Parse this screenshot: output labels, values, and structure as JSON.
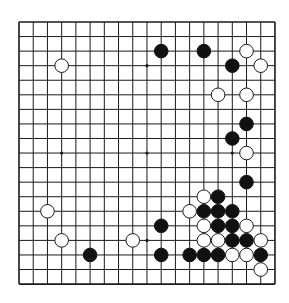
{
  "board": {
    "size": 19,
    "origin_x": 19,
    "origin_y": 22,
    "spacing_x": 14.22,
    "spacing_y": 14.56,
    "line_color": "#1a1a1a",
    "background": "#ffffff",
    "stone_radius": 6.8,
    "star_points": [
      [
        3,
        3
      ],
      [
        9,
        3
      ],
      [
        15,
        3
      ],
      [
        3,
        9
      ],
      [
        9,
        9
      ],
      [
        15,
        9
      ],
      [
        3,
        15
      ],
      [
        9,
        15
      ],
      [
        15,
        15
      ]
    ],
    "colors": {
      "black": "#111111",
      "white": "#ffffff",
      "white_stroke": "#1a1a1a"
    }
  },
  "stones": [
    {
      "color": "black",
      "col": 10,
      "row": 2
    },
    {
      "color": "black",
      "col": 13,
      "row": 2
    },
    {
      "color": "white",
      "col": 16,
      "row": 2
    },
    {
      "color": "white",
      "col": 3,
      "row": 3
    },
    {
      "color": "black",
      "col": 15,
      "row": 3
    },
    {
      "color": "white",
      "col": 17,
      "row": 3
    },
    {
      "color": "white",
      "col": 14,
      "row": 5
    },
    {
      "color": "white",
      "col": 16,
      "row": 5
    },
    {
      "color": "black",
      "col": 16,
      "row": 7
    },
    {
      "color": "black",
      "col": 15,
      "row": 8
    },
    {
      "color": "white",
      "col": 16,
      "row": 9
    },
    {
      "color": "black",
      "col": 16,
      "row": 11
    },
    {
      "color": "white",
      "col": 13,
      "row": 12
    },
    {
      "color": "black",
      "col": 14,
      "row": 12
    },
    {
      "color": "white",
      "col": 2,
      "row": 13
    },
    {
      "color": "white",
      "col": 12,
      "row": 13
    },
    {
      "color": "black",
      "col": 13,
      "row": 13
    },
    {
      "color": "black",
      "col": 14,
      "row": 13
    },
    {
      "color": "black",
      "col": 15,
      "row": 13
    },
    {
      "color": "black",
      "col": 10,
      "row": 14
    },
    {
      "color": "white",
      "col": 13,
      "row": 14
    },
    {
      "color": "black",
      "col": 14,
      "row": 14
    },
    {
      "color": "black",
      "col": 15,
      "row": 14
    },
    {
      "color": "white",
      "col": 16,
      "row": 14
    },
    {
      "color": "white",
      "col": 3,
      "row": 15
    },
    {
      "color": "white",
      "col": 8,
      "row": 15
    },
    {
      "color": "white",
      "col": 13,
      "row": 15
    },
    {
      "color": "white",
      "col": 14,
      "row": 15
    },
    {
      "color": "black",
      "col": 15,
      "row": 15
    },
    {
      "color": "black",
      "col": 16,
      "row": 15
    },
    {
      "color": "white",
      "col": 17,
      "row": 15
    },
    {
      "color": "black",
      "col": 5,
      "row": 16
    },
    {
      "color": "black",
      "col": 10,
      "row": 16
    },
    {
      "color": "black",
      "col": 12,
      "row": 16
    },
    {
      "color": "black",
      "col": 13,
      "row": 16
    },
    {
      "color": "black",
      "col": 14,
      "row": 16
    },
    {
      "color": "white",
      "col": 15,
      "row": 16
    },
    {
      "color": "white",
      "col": 16,
      "row": 16
    },
    {
      "color": "black",
      "col": 17,
      "row": 16
    },
    {
      "color": "white",
      "col": 17,
      "row": 17
    }
  ]
}
